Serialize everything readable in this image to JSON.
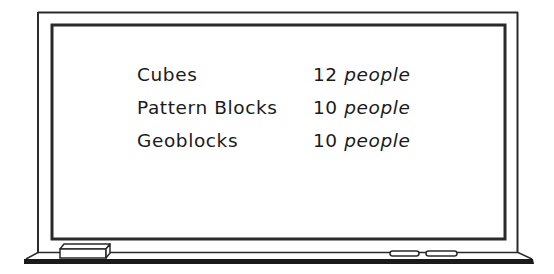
{
  "board": {
    "rows": [
      {
        "label": "Cubes",
        "count": "12",
        "unit": "people"
      },
      {
        "label": "Pattern Blocks",
        "count": "10",
        "unit": "people"
      },
      {
        "label": "Geoblocks",
        "count": "10",
        "unit": "people"
      }
    ]
  },
  "tray": {
    "eraser": "eraser-icon",
    "markers": [
      "marker-icon",
      "marker-icon"
    ]
  },
  "colors": {
    "frame": "#2a2a2a",
    "ledge": "#1a1a1a",
    "board": "#ffffff",
    "text": "#1a1a1a"
  }
}
